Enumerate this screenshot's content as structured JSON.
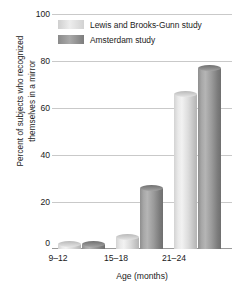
{
  "chart_data": {
    "type": "bar",
    "title": "",
    "xlabel": "Age (months)",
    "ylabel": "Percent of subjects who recognized themselves in a mirror",
    "ylabel_line1": "Percent of subjects who recognized",
    "ylabel_line2": "themselves in a mirror",
    "categories": [
      "9–12",
      "15–18",
      "21–24"
    ],
    "series": [
      {
        "name": "Lewis and Brooks-Gunn study",
        "values": [
          2,
          5,
          66
        ],
        "color": "#e2e2e2"
      },
      {
        "name": "Amsterdam study",
        "values": [
          2,
          26,
          77
        ],
        "color": "#909090"
      }
    ],
    "ylim": [
      0,
      100
    ],
    "yticks": [
      "0",
      "20",
      "40",
      "60",
      "80",
      "100"
    ],
    "ytick_values": [
      0,
      20,
      40,
      60,
      80,
      100
    ],
    "grid": true,
    "legend_position": "top-center"
  }
}
